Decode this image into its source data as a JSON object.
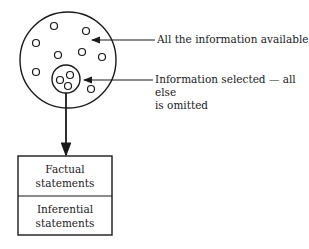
{
  "diagram": {
    "labels": {
      "all_info": "All the information available",
      "selected_line1": "Information selected — all else",
      "selected_line2": "is omitted"
    },
    "box": {
      "top_line1": "Factual",
      "top_line2": "statements",
      "bottom_line1": "Inferential",
      "bottom_line2": "statements"
    },
    "colors": {
      "stroke": "#1a1a1a",
      "background": "#ffffff"
    }
  }
}
